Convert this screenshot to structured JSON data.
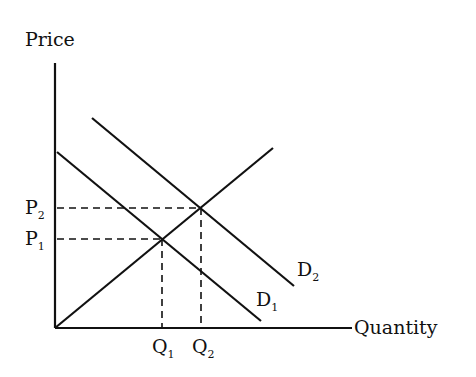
{
  "diagram": {
    "type": "supply-demand",
    "axes": {
      "y_label": "Price",
      "x_label": "Quantity"
    },
    "curves": [
      {
        "id": "supply",
        "label": "",
        "from": [
          55,
          328
        ],
        "to": [
          273,
          148
        ]
      },
      {
        "id": "D1",
        "label": "D",
        "sub": "1",
        "from": [
          57,
          152
        ],
        "to": [
          261,
          321
        ]
      },
      {
        "id": "D2",
        "label": "D",
        "sub": "2",
        "from": [
          92,
          118
        ],
        "to": [
          294,
          286
        ]
      }
    ],
    "equilibria": [
      {
        "price_label": "P",
        "price_sub": "1",
        "quantity_label": "Q",
        "quantity_sub": "1"
      },
      {
        "price_label": "P",
        "price_sub": "2",
        "quantity_label": "Q",
        "quantity_sub": "2"
      }
    ],
    "colors": {
      "line": "#111111",
      "background": "#ffffff"
    }
  }
}
